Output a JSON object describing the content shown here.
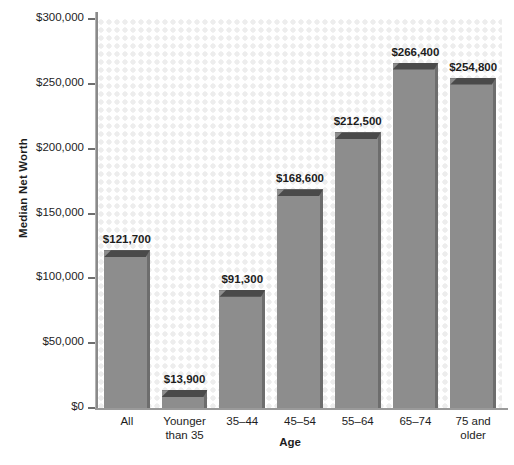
{
  "chart_data": {
    "type": "bar",
    "title": "",
    "xlabel": "Age",
    "ylabel": "Median Net Worth",
    "categories": [
      "All",
      "Younger than 35",
      "35–44",
      "45–54",
      "55–64",
      "65–74",
      "75 and older"
    ],
    "category_lines": [
      [
        "All"
      ],
      [
        "Younger",
        "than 35"
      ],
      [
        "35–44"
      ],
      [
        "45–54"
      ],
      [
        "55–64"
      ],
      [
        "65–74"
      ],
      [
        "75 and",
        "older"
      ]
    ],
    "values": [
      121700,
      13900,
      91300,
      168600,
      212500,
      266400,
      254800
    ],
    "value_labels": [
      "$121,700",
      "$13,900",
      "$91,300",
      "$168,600",
      "$212,500",
      "$266,400",
      "$254,800"
    ],
    "ylim": [
      0,
      300000
    ],
    "ytick_values": [
      0,
      50000,
      100000,
      150000,
      200000,
      250000,
      300000
    ],
    "ytick_labels": [
      "$0",
      "$50,000",
      "$100,000",
      "$150,000",
      "$200,000",
      "$250,000",
      "$300,000"
    ],
    "grid": false,
    "legend": null,
    "bar_color": "#8d8d8d",
    "bar_shadow_color": "#4a4a4a",
    "bar_side_color": "#6d6d6d",
    "axis_color": "#8a8a8a",
    "text_color": "#1d1d1d",
    "plot_background": "#ffffff",
    "plot_texture_color": "#ededed"
  }
}
